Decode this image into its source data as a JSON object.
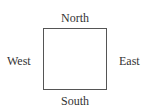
{
  "diagram": {
    "type": "compass-square",
    "labels": {
      "north": "North",
      "south": "South",
      "west": "West",
      "east": "East"
    },
    "colors": {
      "text": "#333333",
      "border": "#555555",
      "background": "#ffffff"
    }
  }
}
